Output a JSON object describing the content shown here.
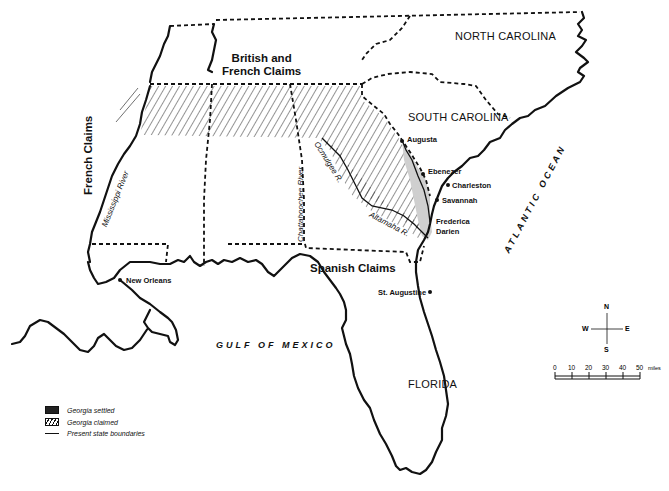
{
  "map": {
    "regions": [
      {
        "id": "north-carolina",
        "label": "NORTH CAROLINA"
      },
      {
        "id": "south-carolina",
        "label": "SOUTH CAROLINA"
      },
      {
        "id": "florida",
        "label": "FLORIDA"
      }
    ],
    "claims": {
      "british_french": "British and\nFrench Claims",
      "british_french_line1": "British and",
      "british_french_line2": "French Claims",
      "french": "French Claims",
      "spanish": "Spanish Claims"
    },
    "cities": [
      {
        "name": "Augusta"
      },
      {
        "name": "Ebenezer"
      },
      {
        "name": "Charleston"
      },
      {
        "name": "Savannah"
      },
      {
        "name": "Frederica"
      },
      {
        "name": "Darien"
      },
      {
        "name": "New Orleans"
      },
      {
        "name": "St. Augustine"
      }
    ],
    "rivers": [
      {
        "name": "Mississippi River"
      },
      {
        "name": "Chattahoochee River"
      },
      {
        "name": "Ocmulgee R."
      },
      {
        "name": "Altamaha R."
      }
    ],
    "water_bodies": [
      {
        "name": "GULF OF MEXICO"
      },
      {
        "name": "ATLANTIC OCEAN"
      }
    ],
    "colors": {
      "ink": "#111111",
      "settled_fill": "#cccccc",
      "background": "#ffffff"
    }
  },
  "compass": {
    "n": "N",
    "s": "S",
    "e": "E",
    "w": "W"
  },
  "scale": {
    "ticks": [
      "0",
      "10",
      "20",
      "30",
      "40",
      "50"
    ],
    "unit": "miles"
  },
  "legend": {
    "items": [
      {
        "label": "Georgia settled"
      },
      {
        "label": "Georgia claimed"
      },
      {
        "label": "Present state boundaries"
      }
    ]
  }
}
